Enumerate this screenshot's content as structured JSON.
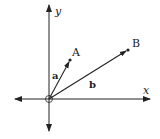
{
  "diagram": {
    "title": "",
    "axes": {
      "x_label": "x",
      "y_label": "y",
      "origin_marker": "open-circle"
    },
    "points": [
      {
        "label": "A"
      },
      {
        "label": "B"
      }
    ],
    "vectors": [
      {
        "label": "a",
        "from": "O",
        "to": "A"
      },
      {
        "label": "b",
        "from": "O",
        "to": "B"
      }
    ],
    "colors": {
      "stroke": "#222222",
      "background": "#ffffff"
    }
  }
}
